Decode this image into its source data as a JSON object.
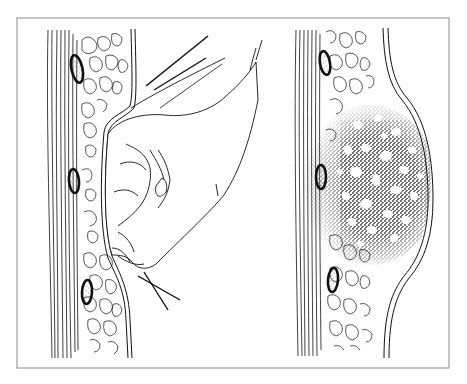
{
  "figure": {
    "frame": {
      "x": 17,
      "y": 18,
      "width": 432,
      "height": 350,
      "stroke": "#8a8a8a"
    },
    "colors": {
      "background": "#ffffff",
      "ink": "#111111",
      "frame": "#8a8a8a"
    },
    "panels": [
      {
        "id": "impact",
        "label": "",
        "elements": [
          "muscle-fibers",
          "fat-lobules",
          "blood-vessels",
          "skin-surface-indented",
          "fist",
          "motion-lines"
        ]
      },
      {
        "id": "bruise",
        "label": "",
        "elements": [
          "muscle-fibers",
          "fat-lobules",
          "blood-vessels",
          "skin-surface-swollen",
          "hemorrhage-stipple"
        ]
      }
    ]
  }
}
